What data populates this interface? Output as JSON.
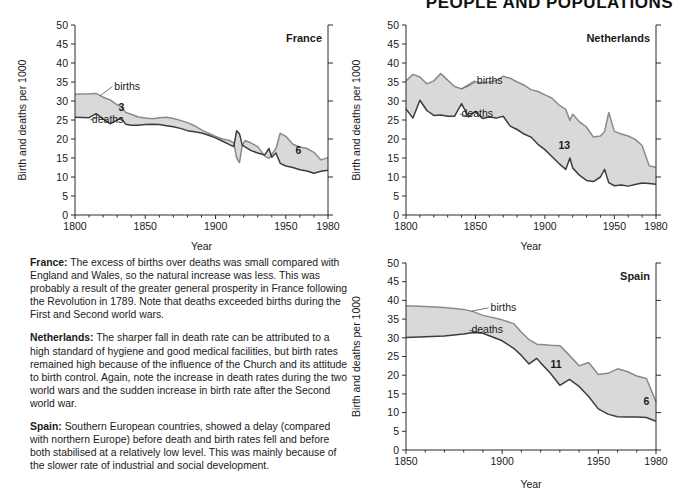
{
  "header": {
    "title": "PEOPLE AND POPULATIONS"
  },
  "labels": {
    "ylabel": "Birth and deaths per 1000",
    "xlabel": "Year",
    "births": "births",
    "deaths": "deaths"
  },
  "notes": [
    {
      "id": "note-france",
      "country": "France:",
      "text": " The excess of births over deaths was small compared with England and Wales, so the natural increase was less. This was probably a result of the greater general prosperity in France following the Revolution in 1789. Note that deaths exceeded births during the First and Second world wars."
    },
    {
      "id": "note-netherlands",
      "country": "Netherlands:",
      "text": " The sharper fall in death rate can be attributed to a high standard of hygiene and good medical facilities, but birth rates remained high because of the influence of the Church and its attitude to birth control. Again, note the increase in death rates during the two world wars and the sudden increase in birth rate after the Second world war."
    },
    {
      "id": "note-spain",
      "country": "Spain:",
      "text": " Southern European countries, showed a delay (compared with northern Europe) before death and birth rates fell and before both stabilised at a relatively low level. This was mainly because of the slower rate of industrial and social development."
    }
  ],
  "chart_data": [
    {
      "id": "france",
      "type": "area",
      "title": "France",
      "xlabel": "Year",
      "ylabel": "Birth and deaths per 1000",
      "xlim": [
        1800,
        1980
      ],
      "ylim": [
        0,
        50
      ],
      "xticks": [
        1800,
        1850,
        1900,
        1950,
        1980
      ],
      "yticks": [
        0,
        5,
        10,
        15,
        20,
        25,
        30,
        35,
        40,
        45,
        50
      ],
      "grid": false,
      "legend": "inline-annotation",
      "annotations": [
        {
          "text": "3",
          "x": 1833,
          "y": 27.5
        },
        {
          "text": "6",
          "x": 1959,
          "y": 16.0
        }
      ],
      "x": [
        1800,
        1810,
        1815,
        1820,
        1825,
        1830,
        1833,
        1836,
        1840,
        1845,
        1850,
        1855,
        1860,
        1865,
        1870,
        1875,
        1880,
        1885,
        1890,
        1895,
        1900,
        1905,
        1910,
        1913,
        1915,
        1917,
        1919,
        1921,
        1925,
        1930,
        1935,
        1938,
        1940,
        1943,
        1946,
        1950,
        1955,
        1960,
        1965,
        1970,
        1975,
        1980
      ],
      "series": [
        {
          "name": "births",
          "values": [
            31.8,
            31.9,
            32.0,
            31.0,
            30.3,
            29.0,
            28.5,
            27.0,
            26.5,
            25.8,
            25.5,
            25.3,
            25.6,
            25.7,
            25.4,
            24.9,
            24.3,
            23.5,
            22.4,
            21.5,
            20.7,
            20.0,
            19.6,
            19.0,
            15.0,
            13.8,
            18.3,
            19.6,
            19.0,
            18.0,
            15.5,
            14.9,
            16.0,
            17.5,
            21.5,
            20.7,
            18.6,
            17.9,
            17.5,
            16.5,
            14.5,
            15.1
          ]
        },
        {
          "name": "deaths",
          "values": [
            25.7,
            25.6,
            26.7,
            25.3,
            24.0,
            25.0,
            25.5,
            23.9,
            23.6,
            23.6,
            23.8,
            23.9,
            23.8,
            23.5,
            23.2,
            22.8,
            22.2,
            21.9,
            21.6,
            21.0,
            20.3,
            19.4,
            18.5,
            18.0,
            22.2,
            21.4,
            18.4,
            17.9,
            17.0,
            16.3,
            15.8,
            17.5,
            15.2,
            16.3,
            13.6,
            12.9,
            12.5,
            11.9,
            11.6,
            11.0,
            11.5,
            11.8
          ]
        }
      ]
    },
    {
      "id": "netherlands",
      "type": "area",
      "title": "Netherlands",
      "xlabel": "Year",
      "ylabel": "Birth and deaths per 1000",
      "xlim": [
        1800,
        1980
      ],
      "ylim": [
        0,
        50
      ],
      "xticks": [
        1800,
        1850,
        1900,
        1950,
        1980
      ],
      "yticks": [
        0,
        5,
        10,
        15,
        20,
        25,
        30,
        35,
        40,
        45,
        50
      ],
      "grid": false,
      "legend": "inline-annotation",
      "annotations": [
        {
          "text": "13",
          "x": 1914,
          "y": 17.5
        }
      ],
      "x": [
        1800,
        1805,
        1810,
        1815,
        1820,
        1825,
        1830,
        1835,
        1840,
        1845,
        1850,
        1855,
        1860,
        1865,
        1870,
        1875,
        1880,
        1885,
        1890,
        1895,
        1900,
        1905,
        1910,
        1915,
        1918,
        1920,
        1925,
        1930,
        1935,
        1940,
        1943,
        1946,
        1950,
        1955,
        1960,
        1965,
        1970,
        1975,
        1980
      ],
      "series": [
        {
          "name": "births",
          "values": [
            35.3,
            37.0,
            36.3,
            34.5,
            35.3,
            37.2,
            35.5,
            33.8,
            33.2,
            34.0,
            35.1,
            34.8,
            35.0,
            35.4,
            36.5,
            36.0,
            35.0,
            34.2,
            33.0,
            32.5,
            31.6,
            30.8,
            29.0,
            27.8,
            24.9,
            26.5,
            24.5,
            23.1,
            20.5,
            20.8,
            22.0,
            27.0,
            22.0,
            21.3,
            20.8,
            19.9,
            18.3,
            13.0,
            12.5
          ]
        },
        {
          "name": "deaths",
          "values": [
            27.9,
            25.5,
            30.2,
            27.5,
            26.2,
            26.3,
            26.0,
            26.0,
            29.3,
            25.8,
            27.3,
            25.4,
            25.8,
            25.5,
            26.0,
            23.4,
            22.5,
            21.3,
            20.5,
            18.6,
            17.2,
            15.4,
            13.6,
            12.0,
            15.0,
            12.4,
            10.4,
            9.1,
            8.8,
            10.0,
            12.0,
            8.5,
            7.7,
            7.9,
            7.6,
            8.0,
            8.4,
            8.3,
            8.1
          ]
        }
      ]
    },
    {
      "id": "spain",
      "type": "area",
      "title": "Spain",
      "xlabel": "Year",
      "ylabel": "Birth and deaths per 1000",
      "xlim": [
        1850,
        1980
      ],
      "ylim": [
        0,
        50
      ],
      "xticks": [
        1850,
        1900,
        1950,
        1980
      ],
      "yticks": [
        0,
        5,
        10,
        15,
        20,
        25,
        30,
        35,
        40,
        45,
        50
      ],
      "grid": false,
      "legend": "inline-annotation",
      "annotations": [
        {
          "text": "11",
          "x": 1928,
          "y": 22.0
        },
        {
          "text": "6",
          "x": 1975,
          "y": 12.0
        }
      ],
      "x": [
        1850,
        1860,
        1870,
        1880,
        1885,
        1890,
        1900,
        1906,
        1910,
        1914,
        1918,
        1920,
        1925,
        1930,
        1935,
        1940,
        1945,
        1950,
        1955,
        1960,
        1965,
        1970,
        1975,
        1980
      ],
      "series": [
        {
          "name": "births",
          "values": [
            38.6,
            38.4,
            38.1,
            37.6,
            37.0,
            36.0,
            34.8,
            33.8,
            31.5,
            29.5,
            28.3,
            28.2,
            28.0,
            27.9,
            25.3,
            22.5,
            23.4,
            20.2,
            20.5,
            21.7,
            21.0,
            19.8,
            19.1,
            12.9
          ]
        },
        {
          "name": "deaths",
          "values": [
            30.1,
            30.3,
            30.5,
            31.0,
            31.4,
            31.2,
            29.2,
            27.2,
            25.3,
            23.0,
            24.5,
            23.3,
            20.6,
            17.3,
            18.9,
            17.0,
            14.3,
            11.0,
            9.6,
            8.9,
            8.8,
            8.8,
            8.7,
            7.7
          ]
        }
      ]
    }
  ]
}
